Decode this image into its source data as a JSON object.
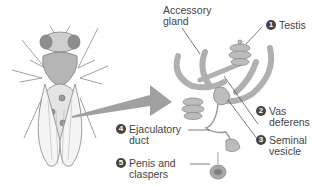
{
  "figure": {
    "colors": {
      "organ_fill": "#b8b8b8",
      "organ_stroke": "#8a8a8a",
      "arrow": "#a0a0a0",
      "text": "#444444",
      "badge": "#444444"
    }
  },
  "labels": {
    "accessory_gland": {
      "line1": "Accessory",
      "line2": "gland"
    },
    "testis": {
      "number": "1",
      "line1": "Testis"
    },
    "vas_deferens": {
      "number": "2",
      "line1": "Vas",
      "line2": "deferens"
    },
    "seminal_vesicle": {
      "number": "3",
      "line1": "Seminal",
      "line2": "vesicle"
    },
    "ejaculatory_duct": {
      "number": "4",
      "line1": "Ejaculatory",
      "line2": "duct"
    },
    "penis_claspers": {
      "number": "5",
      "line1": "Penis and",
      "line2": "claspers"
    }
  }
}
